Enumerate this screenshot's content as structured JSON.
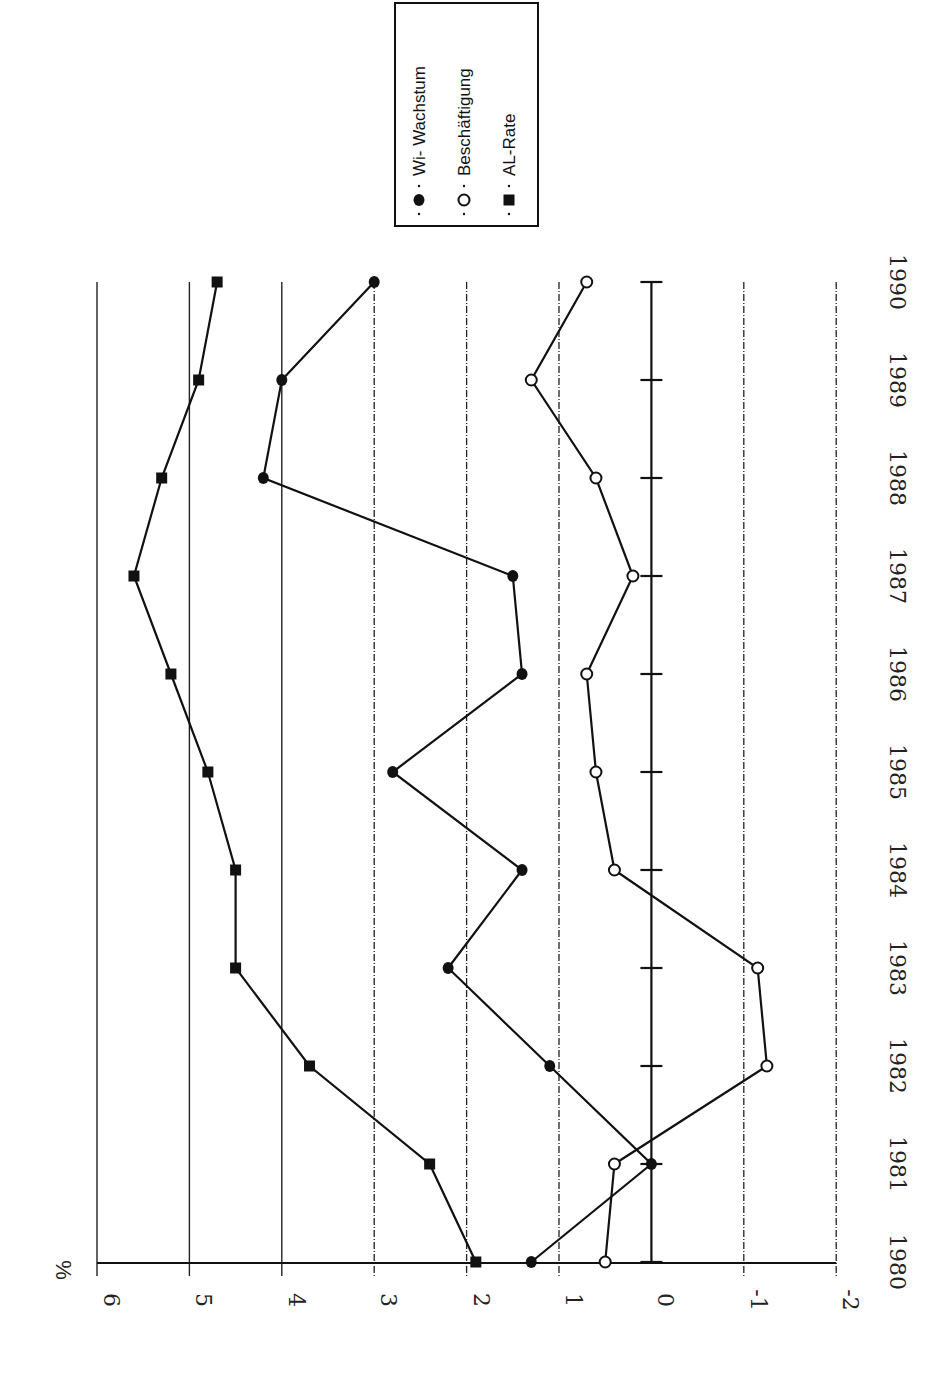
{
  "chart_data": {
    "type": "line",
    "title": "",
    "orientation": "rotated-90-clockwise",
    "xlabel": "",
    "ylabel": "%",
    "ylim": [
      -2,
      6
    ],
    "yticks": [
      "6",
      "5",
      "4",
      "3",
      "2",
      "1",
      "0",
      "-1",
      "-2"
    ],
    "x": [
      "1980",
      "1981",
      "1982",
      "1983",
      "1984",
      "1985",
      "1986",
      "1987",
      "1988",
      "1989",
      "1990"
    ],
    "grid": true,
    "legend_position": "top-right (rotated)",
    "series": [
      {
        "name": "Wi-Wachstum",
        "marker": "filled-circle",
        "values": [
          1.3,
          0.0,
          1.1,
          2.2,
          1.4,
          2.8,
          1.4,
          1.5,
          4.2,
          4.0,
          3.0
        ]
      },
      {
        "name": "Beschäftigung",
        "marker": "open-circle",
        "values": [
          0.5,
          0.4,
          -1.25,
          -1.15,
          0.4,
          0.6,
          0.7,
          0.2,
          0.6,
          1.3,
          0.7
        ]
      },
      {
        "name": "AL-Rate",
        "marker": "filled-square",
        "values": [
          1.9,
          2.4,
          3.7,
          4.5,
          4.5,
          4.8,
          5.2,
          5.6,
          5.3,
          4.9,
          4.7
        ]
      }
    ]
  },
  "legend": {
    "items": [
      {
        "label": "Wi- Wachstum",
        "marker": "filled-circle"
      },
      {
        "label": "Beschäftigung",
        "marker": "open-circle"
      },
      {
        "label": "AL-Rate",
        "marker": "filled-square"
      }
    ]
  },
  "axis": {
    "unit_label": "%"
  }
}
